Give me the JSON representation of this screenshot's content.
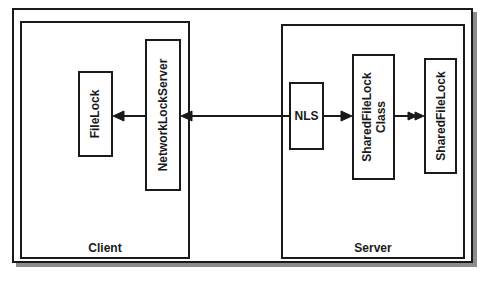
{
  "diagram": {
    "containers": {
      "client": {
        "label": "Client"
      },
      "server": {
        "label": "Server"
      }
    },
    "nodes": {
      "filelock": {
        "label": "FileLock"
      },
      "networklockserver": {
        "label": "NetworkLockServer"
      },
      "nls": {
        "label": "NLS"
      },
      "sharedfilelockclass": {
        "line1": "SharedFileLock",
        "line2": "Class"
      },
      "sharedfilelock": {
        "label": "SharedFileLock"
      }
    },
    "edges": [
      {
        "from": "networklockserver",
        "to": "filelock",
        "style": "single-arrow"
      },
      {
        "from": "nls",
        "to": "networklockserver",
        "style": "single-arrow",
        "note": "line passes across container boundary"
      },
      {
        "from": "nls",
        "to": "sharedfilelockclass",
        "style": "single-arrow"
      },
      {
        "from": "sharedfilelockclass",
        "to": "sharedfilelock",
        "style": "double-arrow"
      }
    ],
    "colors": {
      "stroke": "#1a1a1a",
      "shadow": "#8c8c8c",
      "background": "#ffffff"
    }
  }
}
